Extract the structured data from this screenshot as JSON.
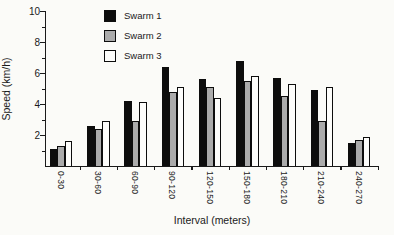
{
  "figure": {
    "background": "#fbfbf8",
    "axis_color": "#1a1a1a"
  },
  "chart_data": {
    "type": "bar",
    "title": "",
    "xlabel": "Interval (meters)",
    "ylabel": "Speed (km/h)",
    "ylim": [
      0,
      10
    ],
    "ytick_labels": [
      10,
      8,
      6,
      4,
      2
    ],
    "ytick_minor": [
      1,
      3,
      5,
      7,
      9
    ],
    "grid": false,
    "legend_position": "top-left-inside",
    "categories": [
      "0-30",
      "30-60",
      "60-90",
      "90-120",
      "120-150",
      "150-180",
      "180-210",
      "210-240",
      "240-270"
    ],
    "series": [
      {
        "name": "Swarm 1",
        "color": "#0d0d0d",
        "values": [
          1.1,
          2.6,
          4.2,
          6.4,
          5.6,
          6.8,
          5.7,
          4.9,
          1.5
        ]
      },
      {
        "name": "Swarm 2",
        "color": "#ababab",
        "values": [
          1.3,
          2.4,
          2.9,
          4.8,
          5.1,
          5.5,
          4.5,
          2.9,
          1.7
        ]
      },
      {
        "name": "Swarm 3",
        "color": "#fdfdfb",
        "values": [
          1.6,
          2.9,
          4.1,
          5.1,
          4.4,
          5.8,
          5.3,
          5.1,
          1.9
        ]
      }
    ]
  }
}
